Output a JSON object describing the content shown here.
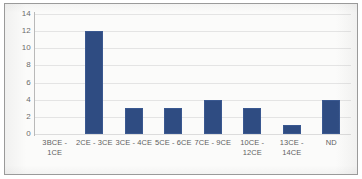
{
  "chart_data": {
    "type": "bar",
    "title": "",
    "subtitle": "",
    "xlabel": "",
    "ylabel": "",
    "categories": [
      "3BCE - 1CE",
      "2CE - 3CE",
      "3CE - 4CE",
      "5CE - 6CE",
      "7CE - 9CE",
      "10CE -\n12CE",
      "13CE -\n14CE",
      "ND"
    ],
    "values": [
      0,
      12,
      3,
      3,
      4,
      3,
      1,
      4
    ],
    "ylim": [
      0,
      14
    ],
    "ytick_values": [
      0,
      2,
      4,
      6,
      8,
      10,
      12,
      14
    ],
    "ytick_labels": [
      "0",
      "2",
      "4",
      "6",
      "8",
      "10",
      "12",
      "14"
    ],
    "grid": true,
    "grid_axis": "y",
    "legend": false,
    "legend_position": "none",
    "bar_color": "#2f4c82",
    "gridline_color": "#e4e4e4",
    "axis_color": "#b9b9b9",
    "tick_label_color": "#5f5f5f",
    "plot_background": "#fbfbfa",
    "border_color": "#9a9a9a"
  }
}
